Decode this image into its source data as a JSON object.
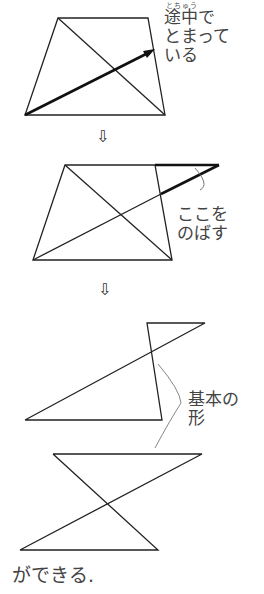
{
  "step1": {
    "ruby": "とちゅう",
    "label_lines": [
      "途中で",
      "とまって",
      "いる"
    ]
  },
  "step2": {
    "label_lines": [
      "ここを",
      "のばす"
    ]
  },
  "step3": {
    "label_lines": [
      "基本の",
      "形"
    ]
  },
  "arrows": [
    "⇩",
    "⇩"
  ],
  "caption": "ができる."
}
